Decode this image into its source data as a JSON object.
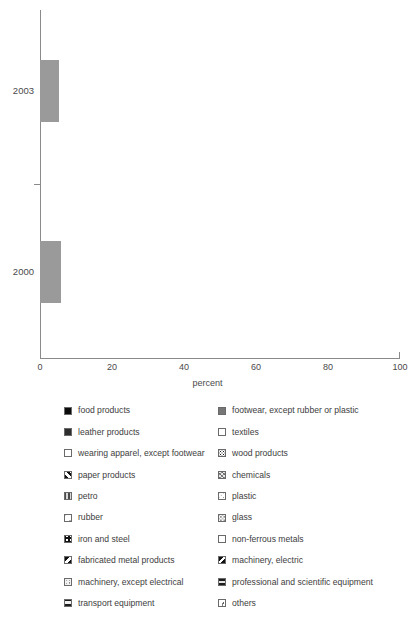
{
  "chart_data": {
    "type": "bar",
    "orientation": "horizontal",
    "stacked": true,
    "title": "",
    "xlabel": "percent",
    "ylabel": "",
    "xlim": [
      0,
      100
    ],
    "xticks": [
      0,
      20,
      40,
      60,
      80,
      100
    ],
    "xticklabels": [
      "0",
      "20",
      "40",
      "60",
      "80",
      "100"
    ],
    "grid": false,
    "legend_position": "bottom",
    "categories": [
      "2003",
      "2000"
    ],
    "series": [
      {
        "name": "food products",
        "pattern": "solid-black",
        "values": [
          26.7,
          35.3
        ]
      },
      {
        "name": "footwear, except rubber or plastic",
        "pattern": "gray-dark",
        "values": [
          0.0,
          4.2
        ]
      },
      {
        "name": "leather products",
        "pattern": "near-black",
        "values": [
          0.0,
          0.6
        ]
      },
      {
        "name": "textiles",
        "pattern": "white",
        "values": [
          4.7,
          3.1
        ]
      },
      {
        "name": "wearing apparel, except footwear",
        "pattern": "dots-fine",
        "values": [
          9.2,
          6.1
        ]
      },
      {
        "name": "wood products",
        "pattern": "dots-dense",
        "values": [
          1.4,
          1.7
        ]
      },
      {
        "name": "paper products",
        "pattern": "diag-fwd-bold",
        "values": [
          4.4,
          3.6
        ]
      },
      {
        "name": "chemicals",
        "pattern": "mottle",
        "values": [
          5.6,
          5.8
        ]
      },
      {
        "name": "petro",
        "pattern": "vstripe",
        "values": [
          1.9,
          0.8
        ]
      },
      {
        "name": "plastic",
        "pattern": "dots-light",
        "values": [
          1.7,
          2.8
        ]
      },
      {
        "name": "iron and steel",
        "pattern": "grid",
        "values": [
          5.0,
          5.6
        ]
      },
      {
        "name": "rubber",
        "pattern": "blobs",
        "values": [
          2.8,
          1.4
        ]
      },
      {
        "name": "glass",
        "pattern": "speckle",
        "values": [
          2.2,
          1.9
        ]
      },
      {
        "name": "non-ferrous metals",
        "pattern": "faint",
        "values": [
          1.1,
          1.4
        ]
      },
      {
        "name": "fabricated metal products",
        "pattern": "diag-back-bold",
        "values": [
          4.7,
          0.8
        ]
      },
      {
        "name": "machinery, electric",
        "pattern": "diag-back-heavy",
        "values": [
          1.1,
          5.3
        ]
      },
      {
        "name": "machinery, except electrical",
        "pattern": "stipple",
        "values": [
          3.6,
          5.0
        ]
      },
      {
        "name": "professional and scientific equipment",
        "pattern": "hstripe",
        "values": [
          1.1,
          0.6
        ]
      },
      {
        "name": "transport equipment",
        "pattern": "hstripe-wide",
        "values": [
          6.1,
          5.6
        ]
      },
      {
        "name": "others",
        "pattern": "flakes",
        "values": [
          3.6,
          0.8
        ]
      }
    ]
  },
  "axis": {
    "x_title": "percent",
    "tick_labels": [
      "0",
      "20",
      "40",
      "60",
      "80",
      "100"
    ],
    "year_labels": [
      "2003",
      "2000"
    ]
  },
  "legend": {
    "left_column": [
      {
        "label": "food products",
        "pattern": "solid-black"
      },
      {
        "label": "leather products",
        "pattern": "near-black"
      },
      {
        "label": "wearing apparel, except footwear",
        "pattern": "dots-fine"
      },
      {
        "label": "paper products",
        "pattern": "diag-fwd-bold"
      },
      {
        "label": "petro",
        "pattern": "vstripe"
      },
      {
        "label": "rubber",
        "pattern": "blobs"
      },
      {
        "label": "iron and steel",
        "pattern": "grid"
      },
      {
        "label": "fabricated metal products",
        "pattern": "diag-back-bold"
      },
      {
        "label": "machinery, except electrical",
        "pattern": "stipple"
      },
      {
        "label": "transport equipment",
        "pattern": "hstripe-wide"
      }
    ],
    "right_column": [
      {
        "label": "footwear, except rubber or plastic",
        "pattern": "gray-dark"
      },
      {
        "label": "textiles",
        "pattern": "white"
      },
      {
        "label": "wood products",
        "pattern": "dots-dense"
      },
      {
        "label": "chemicals",
        "pattern": "mottle"
      },
      {
        "label": "plastic",
        "pattern": "dots-light"
      },
      {
        "label": "glass",
        "pattern": "speckle"
      },
      {
        "label": "non-ferrous metals",
        "pattern": "faint"
      },
      {
        "label": "machinery, electric",
        "pattern": "diag-back-heavy"
      },
      {
        "label": "professional and scientific equipment",
        "pattern": "hstripe"
      },
      {
        "label": "others",
        "pattern": "flakes"
      }
    ]
  },
  "colors": {
    "axis": "#8a8a8a",
    "text": "#3d3d3d",
    "segment_border": "#9a9a9a",
    "background": "#ffffff"
  }
}
